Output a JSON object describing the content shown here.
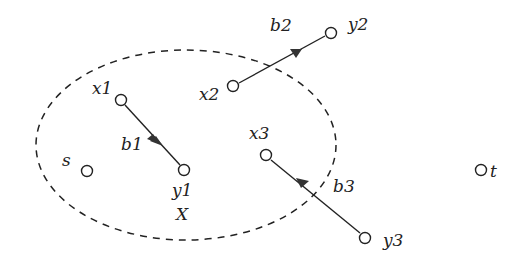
{
  "diagram": {
    "region": {
      "label": "X",
      "cx": 186,
      "cy": 145,
      "rx": 150,
      "ry": 95,
      "style": "dashed"
    },
    "nodes": [
      {
        "id": "s",
        "label": "s",
        "x": 87,
        "y": 171
      },
      {
        "id": "t",
        "label": "t",
        "x": 481,
        "y": 170
      },
      {
        "id": "x1",
        "label": "x1",
        "x": 121,
        "y": 100
      },
      {
        "id": "y1",
        "label": "y1",
        "x": 184,
        "y": 170
      },
      {
        "id": "x2",
        "label": "x2",
        "x": 233,
        "y": 86
      },
      {
        "id": "y2",
        "label": "y2",
        "x": 331,
        "y": 33
      },
      {
        "id": "x3",
        "label": "x3",
        "x": 266,
        "y": 155
      },
      {
        "id": "y3",
        "label": "y3",
        "x": 365,
        "y": 238
      }
    ],
    "edges": [
      {
        "id": "b1",
        "label": "b1",
        "from": "x1",
        "to": "y1",
        "direction": "x1->y1"
      },
      {
        "id": "b2",
        "label": "b2",
        "from": "x2",
        "to": "y2",
        "direction": "x2->y2"
      },
      {
        "id": "b3",
        "label": "b3",
        "from": "y3",
        "to": "x3",
        "direction": "y3->x3"
      }
    ]
  },
  "labels": {
    "s": "s",
    "t": "t",
    "x1": "x1",
    "y1": "y1",
    "x2": "x2",
    "y2": "y2",
    "x3": "x3",
    "y3": "y3",
    "b1": "b1",
    "b2": "b2",
    "b3": "b3",
    "region": "X"
  }
}
